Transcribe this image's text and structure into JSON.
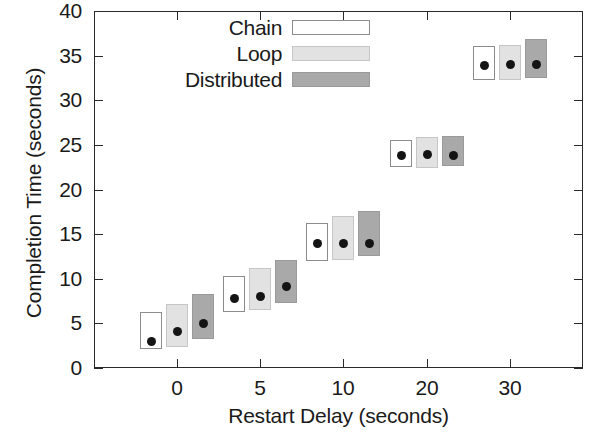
{
  "chart_data": {
    "type": "bar",
    "title": "",
    "xlabel": "Restart Delay (seconds)",
    "ylabel": "Completion Time (seconds)",
    "categories": [
      "0",
      "5",
      "10",
      "20",
      "30"
    ],
    "xtick_labels": [
      "0",
      "5",
      "10",
      "20",
      "30"
    ],
    "ytick_labels": [
      "0",
      "5",
      "10",
      "15",
      "20",
      "25",
      "30",
      "35",
      "40"
    ],
    "ylim": [
      0,
      40
    ],
    "ytick_step": 5,
    "grid": false,
    "legend_position": "top-left-inside",
    "marker": "filled-circle-median",
    "series": [
      {
        "name": "Chain",
        "color": "#ffffff",
        "edge_color": "#8c8c8c",
        "medians": [
          3.0,
          7.8,
          13.9,
          23.8,
          33.9
        ],
        "box_low": [
          2.1,
          6.3,
          12.0,
          22.5,
          32.3
        ],
        "box_high": [
          6.3,
          10.3,
          16.3,
          25.6,
          36.1
        ]
      },
      {
        "name": "Loop",
        "color": "#e2e2e2",
        "edge_color": "#c6c6c6",
        "medians": [
          4.1,
          8.0,
          13.9,
          23.9,
          34.0
        ],
        "box_low": [
          2.3,
          6.5,
          12.1,
          22.4,
          32.3
        ],
        "box_high": [
          7.2,
          11.2,
          17.0,
          25.9,
          36.2
        ]
      },
      {
        "name": "Distributed",
        "color": "#a9a9a9",
        "edge_color": "#9a9a9a",
        "medians": [
          5.0,
          9.1,
          13.9,
          23.8,
          34.0
        ],
        "box_low": [
          3.2,
          7.3,
          12.5,
          22.6,
          32.5
        ],
        "box_high": [
          8.3,
          12.1,
          17.6,
          26.0,
          36.9
        ]
      }
    ]
  },
  "legend": {
    "entries": [
      {
        "label": "Chain",
        "swatch": "legend-swatch-chain"
      },
      {
        "label": "Loop",
        "swatch": "legend-swatch-loop"
      },
      {
        "label": "Distributed",
        "swatch": "legend-swatch-distributed"
      }
    ]
  }
}
